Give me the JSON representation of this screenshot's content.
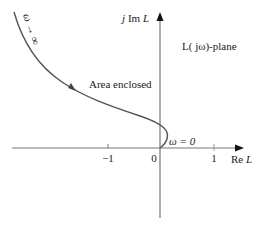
{
  "diagram": {
    "type": "nyquist-plot",
    "plane_label": "L( jω)-plane",
    "axes": {
      "x_label_prefix": "Re ",
      "x_label_var": "L",
      "y_label_prefix": "j Im ",
      "y_label_var": "L",
      "ticks": [
        {
          "value": -1,
          "label": "−1"
        },
        {
          "value": 0,
          "label": "0"
        },
        {
          "value": 1,
          "label": "1"
        }
      ]
    },
    "annotations": {
      "area": "Area enclosed",
      "omega_zero": "ω = 0",
      "omega_inf": "ω → ∞"
    },
    "colors": {
      "curve": "#555555",
      "axis": "#777777",
      "text": "#222222"
    }
  }
}
